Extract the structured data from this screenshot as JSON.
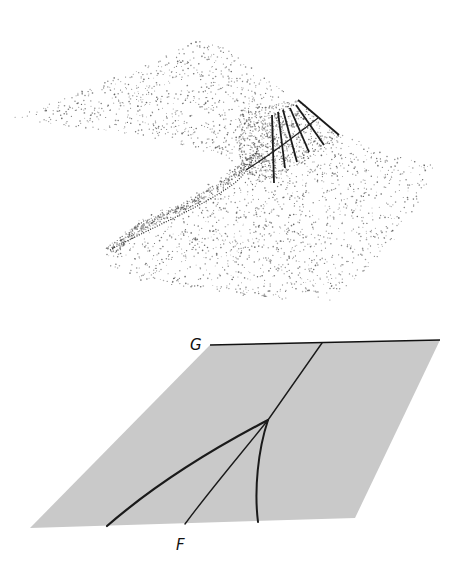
{
  "figure": {
    "width": 460,
    "height": 568,
    "background": "#ffffff",
    "ink_color": "#1a1a1a",
    "stipple_color": "#555555"
  },
  "surface_panel": {
    "description": "Stippled 3D folded (cusp) surface with fold ridge and six ruled lines near the fold",
    "dot_regions": [
      {
        "name": "upper-sheet",
        "polygon": [
          [
            12,
            118
          ],
          [
            60,
            100
          ],
          [
            120,
            75
          ],
          [
            170,
            52
          ],
          [
            200,
            40
          ],
          [
            225,
            48
          ],
          [
            255,
            70
          ],
          [
            285,
            92
          ],
          [
            300,
            110
          ],
          [
            280,
            150
          ],
          [
            255,
            170
          ],
          [
            200,
            150
          ],
          [
            140,
            135
          ],
          [
            60,
            125
          ]
        ],
        "count": 900
      },
      {
        "name": "fold-dense",
        "polygon": [
          [
            240,
            110
          ],
          [
            300,
            100
          ],
          [
            320,
            120
          ],
          [
            340,
            135
          ],
          [
            310,
            160
          ],
          [
            270,
            180
          ],
          [
            245,
            175
          ],
          [
            238,
            150
          ]
        ],
        "count": 700
      },
      {
        "name": "lower-sheet",
        "polygon": [
          [
            105,
            250
          ],
          [
            130,
            225
          ],
          [
            170,
            205
          ],
          [
            215,
            180
          ],
          [
            245,
            160
          ],
          [
            300,
            140
          ],
          [
            345,
            135
          ],
          [
            390,
            155
          ],
          [
            435,
            165
          ],
          [
            420,
            200
          ],
          [
            395,
            240
          ],
          [
            360,
            275
          ],
          [
            330,
            300
          ],
          [
            280,
            300
          ],
          [
            200,
            290
          ],
          [
            140,
            280
          ],
          [
            108,
            265
          ]
        ],
        "count": 1500
      },
      {
        "name": "ridge-edge",
        "polygon": [
          [
            105,
            248
          ],
          [
            140,
            222
          ],
          [
            180,
            205
          ],
          [
            215,
            185
          ],
          [
            240,
            165
          ],
          [
            258,
            150
          ],
          [
            262,
            156
          ],
          [
            244,
            172
          ],
          [
            218,
            192
          ],
          [
            182,
            212
          ],
          [
            145,
            230
          ],
          [
            112,
            255
          ]
        ],
        "count": 450
      }
    ],
    "ruled_lines": [
      {
        "x1": 272,
        "y1": 115,
        "x2": 274,
        "y2": 183
      },
      {
        "x1": 278,
        "y1": 112,
        "x2": 285,
        "y2": 168
      },
      {
        "x1": 283,
        "y1": 110,
        "x2": 297,
        "y2": 162
      },
      {
        "x1": 290,
        "y1": 108,
        "x2": 309,
        "y2": 152
      },
      {
        "x1": 296,
        "y1": 105,
        "x2": 324,
        "y2": 145
      },
      {
        "x1": 298,
        "y1": 100,
        "x2": 339,
        "y2": 135
      }
    ],
    "cross_curve": "M 246 170 C 262 160, 290 140, 318 118",
    "fold_curve": "M 110 250 C 150 228, 200 208, 232 185 C 245 176, 252 162, 258 148"
  },
  "control_plane": {
    "fill_color": "#c9c9c9",
    "corners": [
      [
        210,
        345
      ],
      [
        440,
        340
      ],
      [
        355,
        518
      ],
      [
        30,
        528
      ]
    ],
    "line_G": {
      "x1": 210,
      "y1": 345,
      "x2": 440,
      "y2": 340
    },
    "cusp_point": [
      268,
      420
    ],
    "curves": [
      {
        "name": "main-line-upper",
        "d": "M 322 343 L 268 420",
        "width": 1.4
      },
      {
        "name": "bifurcation-left-branch",
        "d": "M 268 420 C 220 445, 160 480, 107 526",
        "width": 2.2
      },
      {
        "name": "line-F",
        "d": "M 268 420 C 240 455, 210 490, 185 524",
        "width": 1.4
      },
      {
        "name": "bifurcation-right-branch",
        "d": "M 268 420 C 258 450, 254 490, 258 522",
        "width": 2.0
      }
    ],
    "labels": {
      "G": {
        "text": "G",
        "x": 190,
        "y": 350
      },
      "F": {
        "text": "F",
        "x": 176,
        "y": 550
      }
    }
  }
}
